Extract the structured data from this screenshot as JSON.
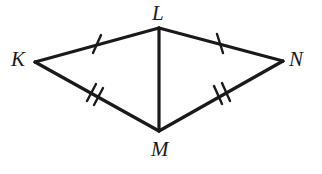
{
  "figure": {
    "name": "kite-diagram-KLMN",
    "background_color": "#ffffff",
    "stroke_color": "#1a1a1a",
    "labels": {
      "K": "K",
      "L": "L",
      "M": "M",
      "N": "N"
    },
    "vertices": {
      "K": {
        "x": 35,
        "y": 62
      },
      "L": {
        "x": 159,
        "y": 28
      },
      "N": {
        "x": 283,
        "y": 61
      },
      "M": {
        "x": 159,
        "y": 131
      }
    },
    "segments": [
      {
        "name": "KL",
        "from": "K",
        "to": "L",
        "tick_count": 1
      },
      {
        "name": "LN",
        "from": "L",
        "to": "N",
        "tick_count": 1
      },
      {
        "name": "KM",
        "from": "K",
        "to": "M",
        "tick_count": 2
      },
      {
        "name": "MN",
        "from": "M",
        "to": "N",
        "tick_count": 2
      },
      {
        "name": "LM",
        "from": "L",
        "to": "M",
        "tick_count": 0
      }
    ],
    "tick_marks": {
      "KL": [
        {
          "x1": 93,
          "y1": 53,
          "x2": 101,
          "y2": 35
        }
      ],
      "LN": [
        {
          "x1": 217,
          "y1": 34,
          "x2": 223,
          "y2": 53
        }
      ],
      "KM": [
        {
          "x1": 87,
          "y1": 101,
          "x2": 96,
          "y2": 84
        },
        {
          "x1": 94,
          "y1": 105,
          "x2": 103,
          "y2": 88
        }
      ],
      "MN": [
        {
          "x1": 214,
          "y1": 86,
          "x2": 222,
          "y2": 104
        },
        {
          "x1": 222,
          "y1": 83,
          "x2": 230,
          "y2": 101
        }
      ]
    },
    "label_positions": {
      "K": {
        "x": 11,
        "y": 49
      },
      "L": {
        "x": 152,
        "y": 3
      },
      "N": {
        "x": 289,
        "y": 49
      },
      "M": {
        "x": 151,
        "y": 139
      }
    }
  }
}
